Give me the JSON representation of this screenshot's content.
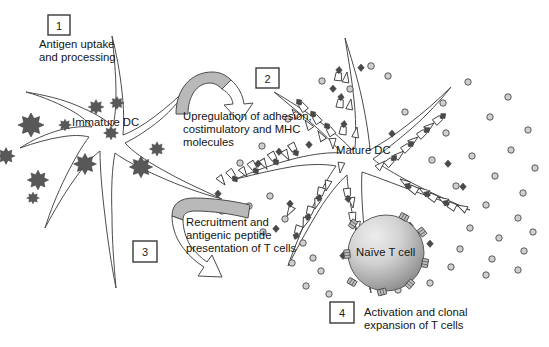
{
  "figure": {
    "background_color": "#ffffff"
  },
  "steps": [
    {
      "number": "1",
      "caption": "Antigen uptake\nand processing",
      "box": {
        "x": 48,
        "y": 15,
        "w": 22,
        "h": 20
      },
      "caption_pos": {
        "x": 39,
        "y": 38
      }
    },
    {
      "number": "2",
      "caption": "Upregulation of adhesion,\ncostimulatory and MHC\nmolecules",
      "box": {
        "x": 256,
        "y": 68,
        "w": 23,
        "h": 20
      },
      "caption_pos": {
        "x": 183,
        "y": 110
      }
    },
    {
      "number": "3",
      "caption": "Recruitment and\nantigenic peptide\npresentation of T cells",
      "box": {
        "x": 133,
        "y": 241,
        "w": 24,
        "h": 21
      },
      "caption_pos": {
        "x": 186,
        "y": 216
      }
    },
    {
      "number": "4",
      "caption": "Activation and clonal\nexpansion of T cells",
      "box": {
        "x": 330,
        "y": 302,
        "w": 24,
        "h": 21
      },
      "caption_pos": {
        "x": 364,
        "y": 306
      }
    }
  ],
  "cell_labels": [
    {
      "name": "immature-dc",
      "text": "Immature DC",
      "x": 72,
      "y": 116
    },
    {
      "name": "mature-dc",
      "text": "Mature DC",
      "x": 336,
      "y": 144
    },
    {
      "name": "naive-t-cell",
      "text": "Naïve T cell",
      "x": 356,
      "y": 253
    }
  ],
  "legend_semantics": {
    "antigen": "dark spiky star particle",
    "cytokine": "small light grey circle",
    "mhc_molecule": "white narrow triangle on dendrite",
    "peptide_mhc_complex": "white cup with dark diamond peptide",
    "t_cell_receptor": "small grey rectangle on T cell surface"
  },
  "colors": {
    "antigen_fill": "#585858",
    "cytokine_fill": "#cfcfcf",
    "outline": "#4a4a4a",
    "arrow_gray": "#b9b9b9",
    "tcell_light": "#e8e8e8",
    "tcell_dark": "#8f8f8f",
    "text": "#141414"
  },
  "counts": {
    "antigen_stars": 11,
    "cytokine_dots": 46,
    "mhc_triangles": 26,
    "peptide_mhc_complexes": 22,
    "t_cell_receptors": 8,
    "numbered_steps": 4
  }
}
